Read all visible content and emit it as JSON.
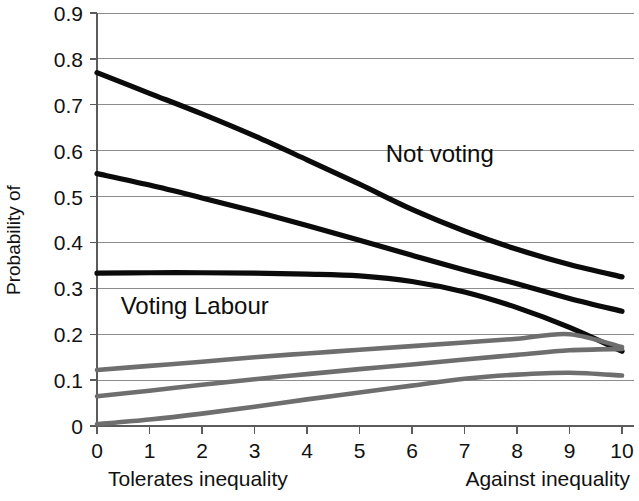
{
  "chart_data": {
    "type": "line",
    "title": "",
    "subtitle": "",
    "xlabel": "",
    "ylabel": "Probability of",
    "xlim": [
      0,
      10
    ],
    "ylim": [
      0,
      0.9
    ],
    "grid": true,
    "legend_position": "inline-annotations",
    "x": [
      0,
      1,
      2,
      3,
      4,
      5,
      6,
      7,
      8,
      9,
      10
    ],
    "xticks": [
      "0",
      "1",
      "2",
      "3",
      "4",
      "5",
      "6",
      "7",
      "8",
      "9",
      "10"
    ],
    "yticks": [
      "0",
      "0.1",
      "0.2",
      "0.3",
      "0.4",
      "0.5",
      "0.6",
      "0.7",
      "0.8",
      "0.9"
    ],
    "ytick_values": [
      0,
      0.1,
      0.2,
      0.3,
      0.4,
      0.5,
      0.6,
      0.7,
      0.8,
      0.9
    ],
    "x_axis_left_label": "Tolerates inequality",
    "x_axis_right_label": "Against inequality",
    "annotations": [
      {
        "text": "Not voting",
        "x": 5.5,
        "y": 0.575
      },
      {
        "text": "Voting Labour",
        "x": 0.45,
        "y": 0.245
      }
    ],
    "series": [
      {
        "name": "Not voting (highest)",
        "color": "#0b0b0b",
        "style": "dark",
        "values": [
          0.77,
          0.725,
          0.68,
          0.632,
          0.58,
          0.527,
          0.472,
          0.425,
          0.385,
          0.352,
          0.325
        ]
      },
      {
        "name": "Not voting (second)",
        "color": "#0b0b0b",
        "style": "dark",
        "values": [
          0.55,
          0.525,
          0.497,
          0.468,
          0.437,
          0.405,
          0.372,
          0.34,
          0.31,
          0.278,
          0.25
        ]
      },
      {
        "name": "Voting Labour",
        "color": "#0b0b0b",
        "style": "dark",
        "values": [
          0.333,
          0.334,
          0.334,
          0.333,
          0.331,
          0.327,
          0.315,
          0.292,
          0.258,
          0.215,
          0.163
        ]
      },
      {
        "name": "Gray series 1",
        "color": "#6e6e6e",
        "style": "gray",
        "values": [
          0.122,
          0.131,
          0.14,
          0.15,
          0.158,
          0.166,
          0.174,
          0.182,
          0.19,
          0.2,
          0.172
        ]
      },
      {
        "name": "Gray series 2",
        "color": "#6e6e6e",
        "style": "gray",
        "values": [
          0.065,
          0.077,
          0.09,
          0.102,
          0.113,
          0.124,
          0.134,
          0.145,
          0.155,
          0.165,
          0.168
        ]
      },
      {
        "name": "Gray series 3",
        "color": "#6e6e6e",
        "style": "gray",
        "values": [
          0.004,
          0.014,
          0.027,
          0.042,
          0.058,
          0.073,
          0.088,
          0.103,
          0.112,
          0.116,
          0.11
        ]
      }
    ]
  }
}
